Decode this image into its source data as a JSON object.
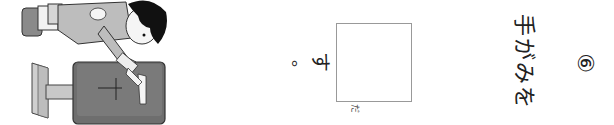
{
  "question": {
    "number": "⑥",
    "text_before": "手がみを",
    "answer_box_furigana": "だ",
    "answer_box_value": "",
    "text_after": "す",
    "period": "。"
  },
  "illustration": {
    "description": "child posting a letter into a mailbox"
  }
}
